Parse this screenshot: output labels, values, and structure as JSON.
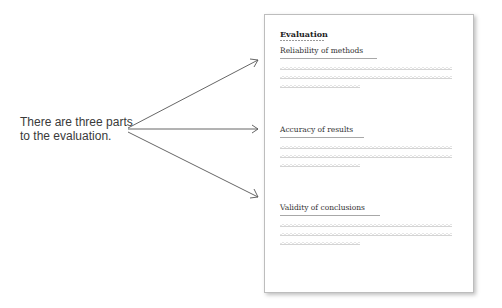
{
  "caption": {
    "line1": "There are three parts",
    "line2": "to the evaluation."
  },
  "document": {
    "title": "Evaluation",
    "sections": [
      {
        "heading": "Reliability of methods"
      },
      {
        "heading": "Accuracy of results"
      },
      {
        "heading": "Validity of conclusions"
      }
    ]
  },
  "arrows": {
    "count": 3,
    "color": "#555555"
  }
}
